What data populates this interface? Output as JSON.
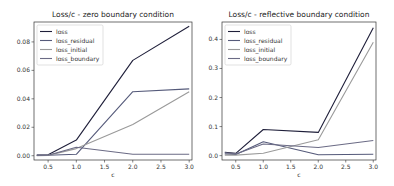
{
  "chart_data": [
    {
      "type": "line",
      "title": "Loss/c - zero boundary condition",
      "xlabel": "c",
      "ylabel": "",
      "x": [
        0.3,
        0.5,
        1.0,
        2.0,
        3.0
      ],
      "xticks": [
        "0.5",
        "1.0",
        "1.5",
        "2.0",
        "2.5",
        "3.0"
      ],
      "yticks": [
        "0.00",
        "0.02",
        "0.04",
        "0.06",
        "0.08"
      ],
      "xlim": [
        0.25,
        3.05
      ],
      "ylim": [
        -0.003,
        0.094
      ],
      "legend_position": "upper left",
      "grid": false,
      "series": [
        {
          "name": "loss",
          "color": "#1f1f3a",
          "values": [
            0.0005,
            0.0007,
            0.011,
            0.067,
            0.091
          ]
        },
        {
          "name": "loss_residual",
          "color": "#555a7a",
          "values": [
            0.0002,
            0.0003,
            0.001,
            0.045,
            0.047
          ]
        },
        {
          "name": "loss_initial",
          "color": "#9a9a9a",
          "values": [
            0.0001,
            0.0002,
            0.005,
            0.022,
            0.045
          ]
        },
        {
          "name": "loss_boundary",
          "color": "#6b6b85",
          "values": [
            0.0002,
            0.0003,
            0.006,
            0.001,
            0.001
          ]
        }
      ]
    },
    {
      "type": "line",
      "title": "Loss/c - reflective boundary condition",
      "xlabel": "c",
      "ylabel": "",
      "x": [
        0.3,
        0.5,
        1.0,
        2.0,
        3.0
      ],
      "xticks": [
        "0.5",
        "1.0",
        "1.5",
        "2.0",
        "2.5",
        "3.0"
      ],
      "yticks": [
        "0.0",
        "0.1",
        "0.2",
        "0.3",
        "0.4"
      ],
      "xlim": [
        0.25,
        3.05
      ],
      "ylim": [
        -0.015,
        0.46
      ],
      "legend_position": "upper left",
      "grid": false,
      "series": [
        {
          "name": "loss",
          "color": "#1f1f3a",
          "values": [
            0.012,
            0.008,
            0.09,
            0.08,
            0.44
          ]
        },
        {
          "name": "loss_residual",
          "color": "#555a7a",
          "values": [
            0.006,
            0.004,
            0.048,
            0.003,
            0.005
          ]
        },
        {
          "name": "loss_initial",
          "color": "#9a9a9a",
          "values": [
            0.002,
            0.002,
            0.008,
            0.055,
            0.39
          ]
        },
        {
          "name": "loss_boundary",
          "color": "#6b6b85",
          "values": [
            0.01,
            0.006,
            0.04,
            0.028,
            0.052
          ]
        }
      ]
    }
  ]
}
